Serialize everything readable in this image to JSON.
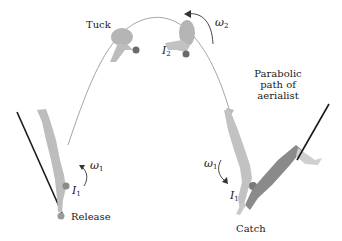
{
  "diagram": {
    "labels": {
      "tuck": "Tuck",
      "release": "Release",
      "catch": "Catch",
      "path_line1": "Parabolic",
      "path_line2": "path of",
      "path_line3": "aerialist"
    },
    "symbols": {
      "omega1_left": {
        "base": "ω",
        "sub": "1"
      },
      "omega1_right": {
        "base": "ω",
        "sub": "1"
      },
      "omega2": {
        "base": "ω",
        "sub": "2"
      },
      "I1_left": {
        "base": "I",
        "sub": "1"
      },
      "I1_right": {
        "base": "I",
        "sub": "1"
      },
      "I2": {
        "base": "I",
        "sub": "2"
      }
    },
    "colors": {
      "figure": "#b9b9b9",
      "figure_dark": "#7a7a7a",
      "catcher": "#8a8a8a",
      "bar": "#1a1a1a",
      "path": "#9a9a9a",
      "text": "#1a1a1a"
    }
  }
}
